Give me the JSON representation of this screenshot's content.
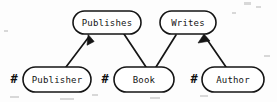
{
  "diagram": {
    "background_color": "#fdfdfd",
    "ink_color": "#151515",
    "key_marker_symbol": "#",
    "entities": [
      {
        "id": "publisher",
        "label": "Publisher",
        "key_marker": "#",
        "cx": 57,
        "cy": 79,
        "w": 68,
        "h": 25
      },
      {
        "id": "book",
        "label": "Book",
        "key_marker": "#",
        "cx": 144,
        "cy": 79,
        "w": 60,
        "h": 25
      },
      {
        "id": "author",
        "label": "Author",
        "key_marker": "#",
        "cx": 233,
        "cy": 79,
        "w": 62,
        "h": 25
      }
    ],
    "relationships": [
      {
        "id": "publishes",
        "label": "Publishes",
        "cx": 107,
        "cy": 22,
        "w": 68,
        "h": 23
      },
      {
        "id": "writes",
        "label": "Writes",
        "cx": 188,
        "cy": 22,
        "w": 56,
        "h": 23
      }
    ],
    "edges": [
      {
        "id": "publisher-publishes",
        "from": "publisher",
        "to": "publishes",
        "arrow": true,
        "arrow_at": "to"
      },
      {
        "id": "publishes-book",
        "from": "publishes",
        "to": "book",
        "arrow": false,
        "arrow_at": "none"
      },
      {
        "id": "book-writes",
        "from": "book",
        "to": "writes",
        "arrow": false,
        "arrow_at": "none"
      },
      {
        "id": "author-writes",
        "from": "author",
        "to": "writes",
        "arrow": true,
        "arrow_at": "to"
      }
    ]
  }
}
